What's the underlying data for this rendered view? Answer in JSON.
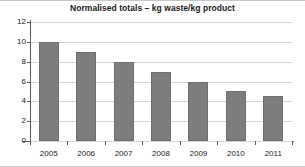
{
  "chart_data": {
    "type": "bar",
    "title": "Normalised totals – kg waste/kg product",
    "xlabel": "",
    "ylabel": "",
    "categories": [
      "2005",
      "2006",
      "2007",
      "2008",
      "2009",
      "2010",
      "2011"
    ],
    "values": [
      10,
      9,
      8,
      7,
      6,
      5,
      4.5
    ],
    "ylim": [
      0,
      12
    ],
    "yticks": [
      0,
      2,
      4,
      6,
      8,
      10,
      12
    ],
    "ytick_labels": [
      "0",
      "2",
      "4",
      "6",
      "8",
      "10",
      "12"
    ],
    "grid": true,
    "legend": false,
    "series": [
      {
        "name": "Normalised totals",
        "values": [
          10,
          9,
          8,
          7,
          6,
          5,
          4.5
        ]
      }
    ],
    "colors": {
      "bar_fill": "#7d7d7d",
      "bar_edge": "#6e6e6e",
      "gridline": "#d6d6d6",
      "axis": "#5a5a5a",
      "text": "#1a1a1a",
      "background": "#ffffff"
    }
  }
}
